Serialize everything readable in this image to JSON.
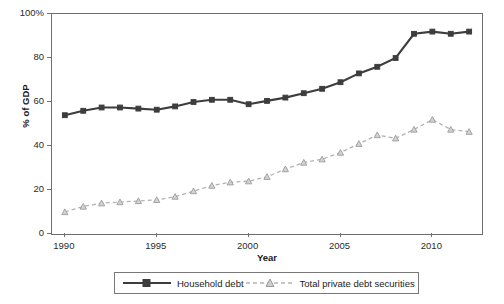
{
  "chart_data": {
    "type": "line",
    "title": "",
    "xlabel": "Year",
    "ylabel": "% of GDP",
    "xlim": [
      1989.3,
      2012.7
    ],
    "ylim": [
      0,
      100
    ],
    "grid": false,
    "legend_position": "bottom",
    "xticks": [
      "1990",
      "1995",
      "2000",
      "2005",
      "2010"
    ],
    "xtick_values": [
      1990,
      1995,
      2000,
      2005,
      2010
    ],
    "yticks": [
      "0",
      "20",
      "40",
      "60",
      "80",
      "100%"
    ],
    "ytick_values": [
      0,
      20,
      40,
      60,
      80,
      100
    ],
    "x": [
      1990,
      1991,
      1992,
      1993,
      1994,
      1995,
      1996,
      1997,
      1998,
      1999,
      2000,
      2001,
      2002,
      2003,
      2004,
      2005,
      2006,
      2007,
      2008,
      2009,
      2010,
      2011,
      2012
    ],
    "series": [
      {
        "name": "Household debt",
        "color": "#3d3d3d",
        "marker": "square",
        "dash": "solid",
        "values": [
          54,
          56,
          57.5,
          57.5,
          57,
          56.5,
          58,
          60,
          61,
          61,
          59,
          60.5,
          62,
          64,
          66,
          69,
          73,
          76,
          80,
          91,
          92,
          91,
          92
        ]
      },
      {
        "name": "Total private debt securities",
        "color": "#b3b3b3",
        "marker": "triangle",
        "dash": "dashed",
        "values": [
          10,
          12.5,
          14,
          14.5,
          15,
          15.5,
          17,
          19.5,
          22,
          23.5,
          24,
          26,
          29.5,
          32.5,
          34,
          37,
          41,
          45,
          43.5,
          47.5,
          52,
          47.5,
          46.5
        ]
      }
    ]
  },
  "legend": {
    "entries": [
      {
        "label": "Household debt"
      },
      {
        "label": "Total private debt securities"
      }
    ]
  }
}
